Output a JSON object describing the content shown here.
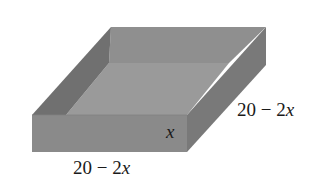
{
  "figure": {
    "labels": {
      "width": "20 − 2",
      "width_var": "x",
      "length": "20 − 2",
      "length_var": "x",
      "height": "x"
    },
    "colors": {
      "background": "#ffffff",
      "front_face": "#8a8a8a",
      "right_face": "#797979",
      "inner_left_wall": "#707070",
      "inner_back_wall": "#8f8f8f",
      "inner_floor": "#9a9a9a",
      "label_text": "#1a1a1a"
    }
  }
}
